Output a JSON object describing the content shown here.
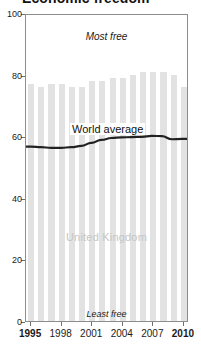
{
  "title": "Economic freedom",
  "annotations": {
    "most_free": "Most free",
    "least_free": "Least free",
    "world_average": "World average",
    "country": "United Kingdom"
  },
  "colors": {
    "bar": "#e2e2e2",
    "line": "#222222",
    "frame": "#8d8d8d",
    "country_label": "#c6c6c6",
    "text": "#1a1a1a"
  },
  "chart_data": {
    "type": "bar",
    "title": "Economic freedom",
    "xlabel": "",
    "ylabel": "",
    "ylim": [
      0,
      100
    ],
    "xlim": [
      1995,
      2010
    ],
    "grid": false,
    "legend": "inline-annotations",
    "ytick_labels": [
      "0",
      "20",
      "40",
      "60",
      "80",
      "100"
    ],
    "ytick_values": [
      0,
      20,
      40,
      60,
      80,
      100
    ],
    "xtick_labels": [
      "1995",
      "1998",
      "2001",
      "2004",
      "2007",
      "2010"
    ],
    "xtick_values": [
      1995,
      1998,
      2001,
      2004,
      2007,
      2010
    ],
    "xtick_bold": [
      true,
      false,
      false,
      false,
      false,
      true
    ],
    "categories": [
      1995,
      1996,
      1997,
      1998,
      1999,
      2000,
      2001,
      2002,
      2003,
      2004,
      2005,
      2006,
      2007,
      2008,
      2009,
      2010
    ],
    "series": [
      {
        "name": "United Kingdom",
        "type": "bar",
        "values": [
          77,
          76,
          77,
          77,
          76,
          76,
          78,
          78,
          79,
          79,
          80,
          81,
          81,
          81,
          80,
          76
        ]
      },
      {
        "name": "World average",
        "type": "line",
        "values": [
          57,
          56.8,
          56.6,
          56.6,
          56.8,
          57.2,
          58.2,
          59.2,
          59.8,
          60,
          60.1,
          60.2,
          60.5,
          60.4,
          59.4,
          59.5
        ]
      }
    ]
  }
}
